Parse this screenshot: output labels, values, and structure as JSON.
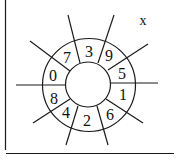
{
  "diagram": {
    "type": "number-wheel",
    "variable_label": "x",
    "center_value": "",
    "ring_numbers": [
      {
        "position": "top",
        "value": "3"
      },
      {
        "position": "top-right",
        "value": "9"
      },
      {
        "position": "right-upper",
        "value": "5"
      },
      {
        "position": "right-lower",
        "value": "1"
      },
      {
        "position": "bottom-right",
        "value": "6"
      },
      {
        "position": "bottom",
        "value": "2"
      },
      {
        "position": "bottom-left",
        "value": "4"
      },
      {
        "position": "left-lower",
        "value": "8"
      },
      {
        "position": "left-upper",
        "value": "0"
      },
      {
        "position": "top-left",
        "value": "7"
      }
    ],
    "colors": {
      "line": "#1a1a1a",
      "background": "#ffffff"
    }
  }
}
